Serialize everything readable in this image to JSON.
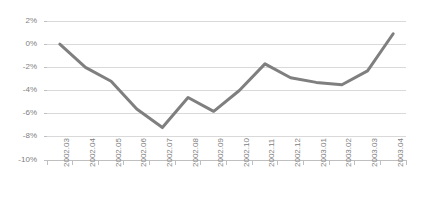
{
  "chart_data": {
    "type": "line",
    "title": "",
    "subtitle": "",
    "xlabel": "",
    "ylabel": "",
    "grid": true,
    "legend": false,
    "legend_position": "none",
    "line_color": "#7f7f7f",
    "gridline_color": "#d9d9d9",
    "axis_color": "#bfbfbf",
    "tick_label_color": "#808080",
    "background_color": "#ffffff",
    "ylim": [
      -10,
      2
    ],
    "ytick_values": [
      2,
      0,
      -2,
      -4,
      -6,
      -8,
      -10
    ],
    "ytick_labels": [
      "2%",
      "0%",
      "-2%",
      "-4%",
      "-6%",
      "-8%",
      "-10%"
    ],
    "categories": [
      "2002.03",
      "2002.04",
      "2002.05",
      "2002.06",
      "2002.07",
      "2002.08",
      "2002.09",
      "2002.10",
      "2002.11",
      "2002.12",
      "2003.01",
      "2003.02",
      "2003.03",
      "2003.04"
    ],
    "values": [
      0.0,
      -2.0,
      -3.2,
      -5.6,
      -7.2,
      -4.6,
      -5.8,
      -4.0,
      -1.7,
      -2.9,
      -3.3,
      -3.5,
      -2.3,
      0.9
    ],
    "series": [
      {
        "name": "Series 1",
        "values": [
          0.0,
          -2.0,
          -3.2,
          -5.6,
          -7.2,
          -4.6,
          -5.8,
          -4.0,
          -1.7,
          -2.9,
          -3.3,
          -3.5,
          -2.3,
          0.9
        ]
      }
    ]
  }
}
